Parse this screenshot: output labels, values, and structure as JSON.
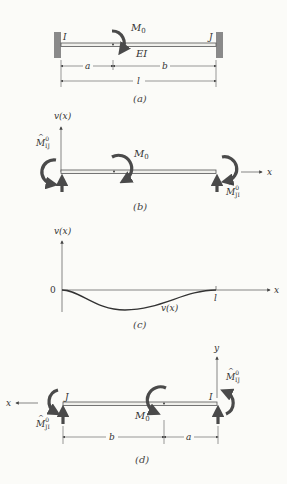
{
  "figure": {
    "panels": [
      {
        "id": "a",
        "caption": "(a)",
        "labels": {
          "left_end": "I",
          "right_end": "J",
          "moment": "M",
          "moment_sub": "0",
          "stiffness": "EI",
          "dim_a": "a",
          "dim_b": "b",
          "dim_l": "l"
        }
      },
      {
        "id": "b",
        "caption": "(b)",
        "labels": {
          "y_axis": "v(x)",
          "x_axis": "x",
          "moment": "M",
          "moment_sub": "0",
          "left_moment": "M",
          "left_moment_sup": "0",
          "left_moment_sub": "IJ",
          "right_moment": "M",
          "right_moment_sup": "0",
          "right_moment_sub": "JI"
        }
      },
      {
        "id": "c",
        "caption": "(c)",
        "labels": {
          "y_axis": "v(x)",
          "x_axis": "x",
          "origin": "0",
          "end": "l",
          "curve": "v(x)"
        }
      },
      {
        "id": "d",
        "caption": "(d)",
        "labels": {
          "y_axis": "y",
          "x_axis": "x",
          "left_end": "J",
          "right_end": "I",
          "moment": "M",
          "moment_sub": "0",
          "left_moment": "M",
          "left_moment_sup": "0",
          "left_moment_sub": "JI",
          "right_moment": "M",
          "right_moment_sup": "0",
          "right_moment_sub": "IJ",
          "dim_b": "b",
          "dim_a": "a"
        }
      }
    ],
    "colors": {
      "ink": "#333333",
      "wall": "#8a8a8a",
      "beam_fill": "#f0f0ec",
      "arrow": "#4a4a4a",
      "background": "#fbfbf8"
    }
  }
}
